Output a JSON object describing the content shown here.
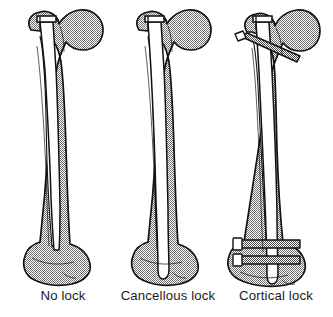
{
  "figure": {
    "type": "medical-illustration",
    "view": "anterior",
    "background_color": "#ffffff",
    "line_color": "#111111",
    "cancellous_fill_color": "#9a9a9a",
    "cortical_fill_color": "#ffffff",
    "implant_fill_color": "#ffffff",
    "panel_count": 3
  },
  "panels": [
    {
      "id": "panel-no-lock",
      "label": "No lock",
      "label_x": 63,
      "label_y": 300,
      "has_proximal_screw": false,
      "has_distal_screws": false,
      "distal_screw_count": 0,
      "nail_tip_depth": "proximal-metaphysis"
    },
    {
      "id": "panel-cancellous-lock",
      "label": "Cancellous lock",
      "label_x": 168,
      "label_y": 300,
      "has_proximal_screw": false,
      "has_distal_screws": false,
      "distal_screw_count": 0,
      "nail_tip_depth": "deep-metaphysis"
    },
    {
      "id": "panel-cortical-lock",
      "label": "Cortical lock",
      "label_x": 276,
      "label_y": 300,
      "has_proximal_screw": true,
      "has_distal_screws": true,
      "distal_screw_count": 2,
      "nail_tip_depth": "condylar-region"
    }
  ]
}
